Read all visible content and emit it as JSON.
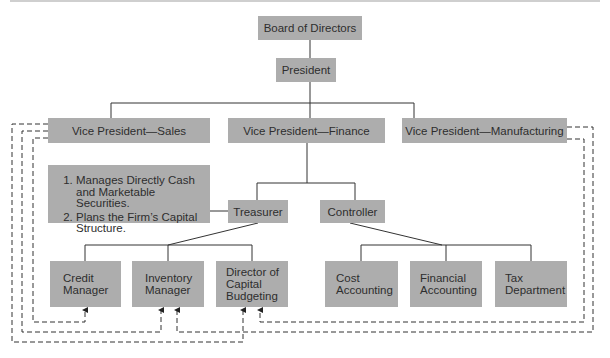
{
  "colors": {
    "box_fill": "#adadad",
    "line": "#333333",
    "text": "#2e2e2e"
  },
  "nodes": {
    "board": "Board of Directors",
    "president": "President",
    "vp_sales": "Vice President—Sales",
    "vp_finance": "Vice President—Finance",
    "vp_manufacturing": "Vice President—Manufacturing",
    "treasurer": "Treasurer",
    "controller": "Controller",
    "credit_manager": [
      "Credit",
      "Manager"
    ],
    "inventory_manager": [
      "Inventory",
      "Manager"
    ],
    "director_capital_budgeting": [
      "Director of",
      "Capital",
      "Budgeting"
    ],
    "cost_accounting": [
      "Cost",
      "Accounting"
    ],
    "financial_accounting": [
      "Financial",
      "Accounting"
    ],
    "tax_department": [
      "Tax",
      "Department"
    ]
  },
  "treasurer_note": {
    "items": [
      "Manages Directly Cash and Marketable Securities.",
      "Plans the Firm’s Capital Structure."
    ]
  }
}
